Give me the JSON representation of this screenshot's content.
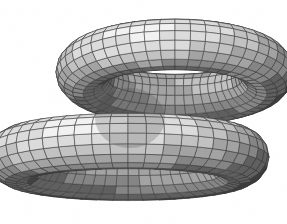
{
  "figure": {
    "kind": "3d-surface-render",
    "title": "",
    "caption": "",
    "background_color": "#ffffff",
    "render_style": "flat-shaded quad mesh with visible wireframe",
    "width": 287,
    "height": 224,
    "palette": {
      "background": "#ffffff",
      "wireframe": "#3a3a3a",
      "highlight": "#f2f2f2",
      "light": "#dcdcdc",
      "mid_light": "#c2c2c2",
      "mid": "#a3a3a3",
      "mid_dark": "#858585",
      "dark": "#5e5e5e",
      "darkest": "#3c3c3c",
      "shadow": "#2a2a2a",
      "outline": "#1f1f1f"
    },
    "mesh": {
      "tube_segments_u": 48,
      "tube_segments_v": 16,
      "wire_width": 0.55,
      "light_direction": [
        -0.45,
        -0.82,
        0.36
      ]
    },
    "lobes": [
      {
        "name": "upper-ring",
        "label": "upper ring lobe",
        "center_x": 175,
        "center_y": 72,
        "ring_radius_x": 92,
        "ring_radius_y": 50,
        "tube_radius": 27,
        "tilt_deg": -9,
        "squash": 0.42,
        "depth_offset": 0
      },
      {
        "name": "lower-ring",
        "label": "lower ring lobe",
        "center_x": 128,
        "center_y": 157,
        "ring_radius_x": 112,
        "ring_radius_y": 52,
        "tube_radius": 29,
        "tilt_deg": 6,
        "squash": 0.4,
        "depth_offset": 40
      }
    ],
    "crossing_region": {
      "label": "tube self-intersection crossing",
      "x": 95,
      "y": 88,
      "width": 70,
      "height": 60,
      "shading": "darkest"
    }
  },
  "annotations": {
    "items": []
  }
}
